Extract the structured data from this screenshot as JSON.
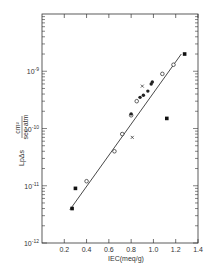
{
  "chart_data": {
    "type": "scatter",
    "title": "",
    "xlabel": "IEC(meq/g)",
    "ylabel": "LpΔs  cm² / sec·atm",
    "xlim": [
      0,
      1.4
    ],
    "ylim_log10": [
      -12,
      -8
    ],
    "yscale": "log",
    "x_ticks": [
      "0.2",
      "0.4",
      "0.6",
      "0.8",
      "1.0",
      "1.2",
      "1.4"
    ],
    "y_ticks": [
      "10⁻¹²",
      "10⁻¹¹",
      "10⁻¹⁰",
      "10⁻⁹"
    ],
    "grid": false,
    "legend": null,
    "series": [
      {
        "name": "filled squares",
        "marker": "square-filled",
        "points": [
          [
            0.27,
            4e-12
          ],
          [
            0.3,
            9e-12
          ],
          [
            1.12,
            1.5e-10
          ],
          [
            1.28,
            2e-09
          ]
        ]
      },
      {
        "name": "open circles",
        "marker": "circle-open",
        "points": [
          [
            0.4,
            1.2e-11
          ],
          [
            0.65,
            4e-11
          ],
          [
            0.72,
            8e-11
          ],
          [
            0.8,
            1.7e-10
          ],
          [
            0.85,
            3e-10
          ],
          [
            1.08,
            9e-10
          ],
          [
            1.18,
            1.3e-09
          ]
        ]
      },
      {
        "name": "filled points",
        "marker": "circle-filled",
        "points": [
          [
            0.8,
            1.8e-10
          ],
          [
            0.88,
            3.5e-10
          ],
          [
            0.91,
            3.8e-10
          ],
          [
            0.95,
            4.5e-10
          ],
          [
            0.98,
            6e-10
          ],
          [
            0.99,
            6.5e-10
          ]
        ]
      },
      {
        "name": "crosses",
        "marker": "x",
        "points": [
          [
            0.81,
            7e-11
          ],
          [
            0.9,
            5.5e-10
          ]
        ]
      }
    ],
    "fit_line": {
      "from": [
        0.25,
        3.8e-12
      ],
      "to": [
        1.25,
        2e-09
      ]
    }
  },
  "labels": {
    "x_axis_title": "IEC(meq/g)",
    "y_axis_prefix": "LpΔs",
    "y_axis_num": "cm²",
    "y_axis_den": "sec·atm"
  }
}
